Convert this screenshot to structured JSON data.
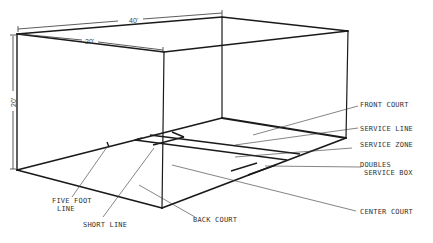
{
  "diagram": {
    "dimensions": {
      "length": "40'",
      "width": "20'",
      "height": "20'"
    },
    "labels": {
      "front_court": "FRONT COURT",
      "service_line": "SERVICE LINE",
      "service_zone": "SERVICE ZONE",
      "doubles_service_box_1": "DOUBLES",
      "doubles_service_box_2": "SERVICE BOX",
      "center_court": "CENTER COURT",
      "back_court": "BACK COURT",
      "short_line": "SHORT LINE",
      "five_foot_line_1": "FIVE FOOT",
      "five_foot_line_2": "LINE"
    },
    "colors": {
      "line": "#1a1a1a",
      "text": "#333333",
      "background": "#ffffff"
    }
  }
}
